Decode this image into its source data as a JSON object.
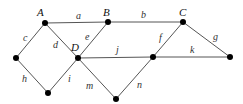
{
  "graph": {
    "nodes": [
      {
        "id": "A",
        "label": "A",
        "x": 45,
        "y": 23,
        "lx": 37,
        "ly": 16
      },
      {
        "id": "B",
        "label": "B",
        "x": 108,
        "y": 22,
        "lx": 103,
        "ly": 16
      },
      {
        "id": "C",
        "label": "C",
        "x": 183,
        "y": 22,
        "lx": 179,
        "ly": 16
      },
      {
        "id": "D",
        "label": "D",
        "x": 78,
        "y": 58,
        "lx": 71,
        "ly": 51
      },
      {
        "id": "E",
        "label": "",
        "x": 153,
        "y": 57
      },
      {
        "id": "F",
        "label": "",
        "x": 230,
        "y": 57
      },
      {
        "id": "G",
        "label": "",
        "x": 16,
        "y": 58
      },
      {
        "id": "H",
        "label": "",
        "x": 48,
        "y": 93
      },
      {
        "id": "I",
        "label": "",
        "x": 116,
        "y": 99
      }
    ],
    "edges": [
      {
        "label": "a",
        "from": "A",
        "to": "B",
        "lx": 76,
        "ly": 19
      },
      {
        "label": "b",
        "from": "B",
        "to": "C",
        "lx": 141,
        "ly": 18
      },
      {
        "label": "c",
        "from": "A",
        "to": "G",
        "lx": 23,
        "ly": 41
      },
      {
        "label": "d",
        "from": "A",
        "to": "D",
        "lx": 53,
        "ly": 48
      },
      {
        "label": "e",
        "from": "B",
        "to": "D",
        "lx": 85,
        "ly": 40
      },
      {
        "label": "f",
        "from": "C",
        "to": "E",
        "lx": 159,
        "ly": 41
      },
      {
        "label": "g",
        "from": "C",
        "to": "F",
        "lx": 213,
        "ly": 40
      },
      {
        "label": "h",
        "from": "G",
        "to": "H",
        "lx": 22,
        "ly": 82
      },
      {
        "label": "i",
        "from": "D",
        "to": "H",
        "lx": 68,
        "ly": 82
      },
      {
        "label": "j",
        "from": "D",
        "to": "E",
        "lx": 116,
        "ly": 53
      },
      {
        "label": "k",
        "from": "E",
        "to": "F",
        "lx": 190,
        "ly": 53
      },
      {
        "label": "m",
        "from": "D",
        "to": "I",
        "lx": 86,
        "ly": 89
      },
      {
        "label": "n",
        "from": "E",
        "to": "I",
        "lx": 137,
        "ly": 88
      }
    ]
  }
}
